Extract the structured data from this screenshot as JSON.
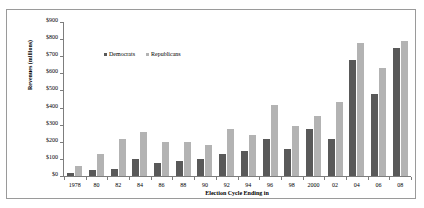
{
  "chart_data": {
    "type": "bar",
    "title": "",
    "xlabel": "Election Cycle Ending in",
    "ylabel": "Revenues (millions)",
    "ylim": [
      0,
      900
    ],
    "ytick_labels": [
      "$900",
      "$800",
      "$700",
      "$600",
      "$500",
      "$400",
      "$300",
      "$200",
      "$100",
      "$0"
    ],
    "ytick_values": [
      900,
      800,
      700,
      600,
      500,
      400,
      300,
      200,
      100,
      0
    ],
    "grid": false,
    "legend_position": "top-center-inside",
    "categories": [
      "1978",
      "80",
      "82",
      "84",
      "86",
      "88",
      "90",
      "92",
      "94",
      "96",
      "98",
      "2000",
      "02",
      "04",
      "06",
      "08"
    ],
    "series": [
      {
        "name": "Democrats",
        "color": "#595959",
        "values": [
          20,
          35,
          40,
          100,
          75,
          90,
          100,
          130,
          145,
          215,
          160,
          275,
          215,
          680,
          480,
          750
        ]
      },
      {
        "name": "Republicans",
        "color": "#b3b3b3",
        "values": [
          60,
          130,
          215,
          255,
          200,
          200,
          180,
          275,
          240,
          415,
          290,
          350,
          430,
          780,
          630,
          790
        ]
      }
    ]
  },
  "legend": {
    "entries": [
      {
        "label": "Democrats",
        "marker": "dem-square-marker"
      },
      {
        "label": "Republicans",
        "marker": "rep-square-marker"
      }
    ]
  }
}
